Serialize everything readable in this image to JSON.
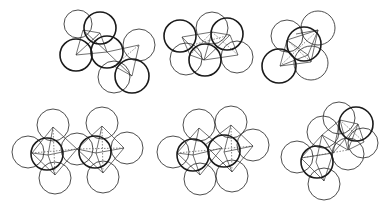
{
  "figure": {
    "width": 392,
    "height": 210,
    "background": "#ffffff",
    "stroke_color": "#1a1a1a",
    "panels": [
      {
        "id": "top-left",
        "spheres": [
          {
            "cx": 78,
            "cy": 24,
            "r": 14,
            "bold": false
          },
          {
            "cx": 139,
            "cy": 45,
            "r": 16,
            "bold": false
          },
          {
            "cx": 114,
            "cy": 77,
            "r": 16,
            "bold": false
          },
          {
            "cx": 107,
            "cy": 52,
            "r": 16,
            "bold": true
          },
          {
            "cx": 76,
            "cy": 55,
            "r": 16,
            "bold": true
          },
          {
            "cx": 100,
            "cy": 28,
            "r": 16,
            "bold": true
          },
          {
            "cx": 132,
            "cy": 76,
            "r": 17,
            "bold": true
          }
        ],
        "edges": [
          {
            "x1": 83,
            "y1": 30,
            "x2": 100,
            "y2": 33,
            "dashed": false
          },
          {
            "x1": 100,
            "y1": 33,
            "x2": 76,
            "y2": 55,
            "dashed": false
          },
          {
            "x1": 83,
            "y1": 30,
            "x2": 76,
            "y2": 55,
            "dashed": false
          },
          {
            "x1": 83,
            "y1": 30,
            "x2": 107,
            "y2": 52,
            "dashed": false
          },
          {
            "x1": 100,
            "y1": 33,
            "x2": 107,
            "y2": 52,
            "dashed": false
          },
          {
            "x1": 76,
            "y1": 55,
            "x2": 107,
            "y2": 52,
            "dashed": false
          },
          {
            "x1": 107,
            "y1": 52,
            "x2": 139,
            "y2": 45,
            "dashed": false
          },
          {
            "x1": 139,
            "y1": 45,
            "x2": 132,
            "y2": 76,
            "dashed": false
          },
          {
            "x1": 107,
            "y1": 52,
            "x2": 132,
            "y2": 76,
            "dashed": false
          },
          {
            "x1": 114,
            "y1": 66,
            "x2": 139,
            "y2": 45,
            "dashed": true
          },
          {
            "x1": 114,
            "y1": 66,
            "x2": 132,
            "y2": 76,
            "dashed": false
          },
          {
            "x1": 90,
            "y1": 42,
            "x2": 100,
            "y2": 33,
            "dashed": true
          }
        ]
      },
      {
        "id": "top-middle",
        "spheres": [
          {
            "cx": 186,
            "cy": 59,
            "r": 16,
            "bold": false
          },
          {
            "cx": 212,
            "cy": 28,
            "r": 16,
            "bold": false
          },
          {
            "cx": 237,
            "cy": 57,
            "r": 16,
            "bold": false
          },
          {
            "cx": 180,
            "cy": 36,
            "r": 16,
            "bold": true
          },
          {
            "cx": 227,
            "cy": 34,
            "r": 16,
            "bold": true
          },
          {
            "cx": 205,
            "cy": 60,
            "r": 16,
            "bold": true
          }
        ],
        "edges": [
          {
            "x1": 182,
            "y1": 37,
            "x2": 212,
            "y2": 32,
            "dashed": false
          },
          {
            "x1": 212,
            "y1": 32,
            "x2": 230,
            "y2": 35,
            "dashed": false
          },
          {
            "x1": 182,
            "y1": 37,
            "x2": 204,
            "y2": 60,
            "dashed": false
          },
          {
            "x1": 212,
            "y1": 32,
            "x2": 204,
            "y2": 60,
            "dashed": false
          },
          {
            "x1": 230,
            "y1": 35,
            "x2": 204,
            "y2": 60,
            "dashed": false
          },
          {
            "x1": 230,
            "y1": 35,
            "x2": 238,
            "y2": 55,
            "dashed": false
          },
          {
            "x1": 204,
            "y1": 60,
            "x2": 238,
            "y2": 55,
            "dashed": false
          },
          {
            "x1": 182,
            "y1": 37,
            "x2": 190,
            "y2": 55,
            "dashed": false
          },
          {
            "x1": 190,
            "y1": 55,
            "x2": 204,
            "y2": 60,
            "dashed": false
          },
          {
            "x1": 190,
            "y1": 55,
            "x2": 212,
            "y2": 32,
            "dashed": true
          },
          {
            "x1": 212,
            "y1": 32,
            "x2": 238,
            "y2": 55,
            "dashed": true
          },
          {
            "x1": 196,
            "y1": 44,
            "x2": 230,
            "y2": 35,
            "dashed": true
          }
        ]
      },
      {
        "id": "top-right",
        "spheres": [
          {
            "cx": 287,
            "cy": 36,
            "r": 16,
            "bold": false
          },
          {
            "cx": 318,
            "cy": 28,
            "r": 17,
            "bold": false
          },
          {
            "cx": 311,
            "cy": 63,
            "r": 17,
            "bold": false
          },
          {
            "cx": 304,
            "cy": 44,
            "r": 17,
            "bold": true
          },
          {
            "cx": 279,
            "cy": 66,
            "r": 17,
            "bold": true
          }
        ],
        "edges": [
          {
            "x1": 287,
            "y1": 40,
            "x2": 318,
            "y2": 30,
            "dashed": false
          },
          {
            "x1": 318,
            "y1": 30,
            "x2": 308,
            "y2": 55,
            "dashed": false
          },
          {
            "x1": 287,
            "y1": 40,
            "x2": 308,
            "y2": 55,
            "dashed": false
          },
          {
            "x1": 287,
            "y1": 40,
            "x2": 280,
            "y2": 66,
            "dashed": false
          },
          {
            "x1": 280,
            "y1": 66,
            "x2": 308,
            "y2": 55,
            "dashed": false
          },
          {
            "x1": 280,
            "y1": 66,
            "x2": 311,
            "y2": 62,
            "dashed": false
          },
          {
            "x1": 311,
            "y1": 62,
            "x2": 308,
            "y2": 55,
            "dashed": false
          },
          {
            "x1": 311,
            "y1": 62,
            "x2": 318,
            "y2": 30,
            "dashed": false
          },
          {
            "x1": 287,
            "y1": 40,
            "x2": 311,
            "y2": 62,
            "dashed": true
          },
          {
            "x1": 280,
            "y1": 66,
            "x2": 318,
            "y2": 30,
            "dashed": true
          },
          {
            "x1": 296,
            "y1": 34,
            "x2": 318,
            "y2": 30,
            "dashed": false
          }
        ]
      },
      {
        "id": "bottom-left",
        "spheres": [
          {
            "cx": 53,
            "cy": 125,
            "r": 16,
            "bold": false
          },
          {
            "cx": 28,
            "cy": 152,
            "r": 16,
            "bold": false
          },
          {
            "cx": 55,
            "cy": 178,
            "r": 16,
            "bold": false
          },
          {
            "cx": 77,
            "cy": 149,
            "r": 16,
            "bold": false
          },
          {
            "cx": 102,
            "cy": 123,
            "r": 16,
            "bold": false
          },
          {
            "cx": 127,
            "cy": 148,
            "r": 16,
            "bold": false
          },
          {
            "cx": 103,
            "cy": 177,
            "r": 16,
            "bold": false
          },
          {
            "cx": 47,
            "cy": 154,
            "r": 16,
            "bold": true
          },
          {
            "cx": 95,
            "cy": 152,
            "r": 16,
            "bold": true
          }
        ],
        "edges": [
          {
            "x1": 53,
            "y1": 127,
            "x2": 32,
            "y2": 153,
            "dashed": false
          },
          {
            "x1": 53,
            "y1": 127,
            "x2": 77,
            "y2": 149,
            "dashed": false
          },
          {
            "x1": 53,
            "y1": 127,
            "x2": 48,
            "y2": 155,
            "dashed": false
          },
          {
            "x1": 55,
            "y1": 175,
            "x2": 32,
            "y2": 153,
            "dashed": false
          },
          {
            "x1": 55,
            "y1": 175,
            "x2": 77,
            "y2": 149,
            "dashed": false
          },
          {
            "x1": 55,
            "y1": 175,
            "x2": 48,
            "y2": 155,
            "dashed": false
          },
          {
            "x1": 32,
            "y1": 153,
            "x2": 48,
            "y2": 155,
            "dashed": false
          },
          {
            "x1": 48,
            "y1": 155,
            "x2": 77,
            "y2": 149,
            "dashed": false
          },
          {
            "x1": 32,
            "y1": 153,
            "x2": 77,
            "y2": 149,
            "dashed": true
          },
          {
            "x1": 53,
            "y1": 127,
            "x2": 55,
            "y2": 175,
            "dashed": true
          },
          {
            "x1": 102,
            "y1": 126,
            "x2": 77,
            "y2": 149,
            "dashed": false
          },
          {
            "x1": 102,
            "y1": 126,
            "x2": 124,
            "y2": 148,
            "dashed": false
          },
          {
            "x1": 102,
            "y1": 126,
            "x2": 96,
            "y2": 153,
            "dashed": false
          },
          {
            "x1": 103,
            "y1": 173,
            "x2": 77,
            "y2": 149,
            "dashed": false
          },
          {
            "x1": 103,
            "y1": 173,
            "x2": 124,
            "y2": 148,
            "dashed": false
          },
          {
            "x1": 103,
            "y1": 173,
            "x2": 96,
            "y2": 153,
            "dashed": false
          },
          {
            "x1": 77,
            "y1": 149,
            "x2": 96,
            "y2": 153,
            "dashed": false
          },
          {
            "x1": 96,
            "y1": 153,
            "x2": 124,
            "y2": 148,
            "dashed": false
          },
          {
            "x1": 77,
            "y1": 149,
            "x2": 124,
            "y2": 148,
            "dashed": true
          },
          {
            "x1": 102,
            "y1": 126,
            "x2": 103,
            "y2": 173,
            "dashed": true
          }
        ]
      },
      {
        "id": "bottom-middle",
        "spheres": [
          {
            "cx": 199,
            "cy": 125,
            "r": 16,
            "bold": false
          },
          {
            "cx": 173,
            "cy": 152,
            "r": 16,
            "bold": false
          },
          {
            "cx": 200,
            "cy": 179,
            "r": 16,
            "bold": false
          },
          {
            "cx": 231,
            "cy": 122,
            "r": 16,
            "bold": false
          },
          {
            "cx": 253,
            "cy": 145,
            "r": 16,
            "bold": false
          },
          {
            "cx": 232,
            "cy": 176,
            "r": 16,
            "bold": false
          },
          {
            "cx": 193,
            "cy": 155,
            "r": 16,
            "bold": true
          },
          {
            "cx": 224,
            "cy": 151,
            "r": 16,
            "bold": true
          }
        ],
        "edges": [
          {
            "x1": 199,
            "y1": 128,
            "x2": 177,
            "y2": 153,
            "dashed": false
          },
          {
            "x1": 199,
            "y1": 128,
            "x2": 193,
            "y2": 155,
            "dashed": false
          },
          {
            "x1": 199,
            "y1": 128,
            "x2": 222,
            "y2": 148,
            "dashed": false
          },
          {
            "x1": 200,
            "y1": 175,
            "x2": 177,
            "y2": 153,
            "dashed": false
          },
          {
            "x1": 200,
            "y1": 175,
            "x2": 193,
            "y2": 155,
            "dashed": false
          },
          {
            "x1": 200,
            "y1": 175,
            "x2": 222,
            "y2": 148,
            "dashed": false
          },
          {
            "x1": 177,
            "y1": 153,
            "x2": 193,
            "y2": 155,
            "dashed": false
          },
          {
            "x1": 193,
            "y1": 155,
            "x2": 222,
            "y2": 148,
            "dashed": false
          },
          {
            "x1": 177,
            "y1": 153,
            "x2": 253,
            "y2": 146,
            "dashed": true
          },
          {
            "x1": 231,
            "y1": 125,
            "x2": 205,
            "y2": 145,
            "dashed": false
          },
          {
            "x1": 231,
            "y1": 125,
            "x2": 253,
            "y2": 146,
            "dashed": false
          },
          {
            "x1": 231,
            "y1": 125,
            "x2": 224,
            "y2": 152,
            "dashed": false
          },
          {
            "x1": 232,
            "y1": 172,
            "x2": 205,
            "y2": 145,
            "dashed": false
          },
          {
            "x1": 232,
            "y1": 172,
            "x2": 253,
            "y2": 146,
            "dashed": false
          },
          {
            "x1": 232,
            "y1": 172,
            "x2": 224,
            "y2": 152,
            "dashed": false
          },
          {
            "x1": 224,
            "y1": 152,
            "x2": 253,
            "y2": 146,
            "dashed": false
          },
          {
            "x1": 231,
            "y1": 125,
            "x2": 232,
            "y2": 172,
            "dashed": true
          }
        ]
      },
      {
        "id": "bottom-right",
        "spheres": [
          {
            "cx": 297,
            "cy": 157,
            "r": 16,
            "bold": false
          },
          {
            "cx": 324,
            "cy": 184,
            "r": 16,
            "bold": false
          },
          {
            "cx": 323,
            "cy": 132,
            "r": 16,
            "bold": false
          },
          {
            "cx": 339,
            "cy": 118,
            "r": 16,
            "bold": false
          },
          {
            "cx": 363,
            "cy": 143,
            "r": 15,
            "bold": false
          },
          {
            "cx": 348,
            "cy": 154,
            "r": 16,
            "bold": false
          },
          {
            "cx": 356,
            "cy": 124,
            "r": 17,
            "bold": true
          },
          {
            "cx": 317,
            "cy": 162,
            "r": 16,
            "bold": true
          }
        ],
        "edges": [
          {
            "x1": 301,
            "y1": 158,
            "x2": 333,
            "y2": 153,
            "dashed": false
          },
          {
            "x1": 301,
            "y1": 158,
            "x2": 324,
            "y2": 181,
            "dashed": false
          },
          {
            "x1": 324,
            "y1": 181,
            "x2": 333,
            "y2": 153,
            "dashed": false
          },
          {
            "x1": 301,
            "y1": 158,
            "x2": 322,
            "y2": 135,
            "dashed": false
          },
          {
            "x1": 322,
            "y1": 135,
            "x2": 333,
            "y2": 153,
            "dashed": false
          },
          {
            "x1": 322,
            "y1": 135,
            "x2": 316,
            "y2": 162,
            "dashed": false
          },
          {
            "x1": 316,
            "y1": 162,
            "x2": 324,
            "y2": 181,
            "dashed": false
          },
          {
            "x1": 301,
            "y1": 158,
            "x2": 348,
            "y2": 150,
            "dashed": true
          },
          {
            "x1": 322,
            "y1": 135,
            "x2": 340,
            "y2": 120,
            "dashed": false
          },
          {
            "x1": 340,
            "y1": 120,
            "x2": 358,
            "y2": 124,
            "dashed": false
          },
          {
            "x1": 358,
            "y1": 124,
            "x2": 364,
            "y2": 142,
            "dashed": false
          },
          {
            "x1": 340,
            "y1": 120,
            "x2": 348,
            "y2": 150,
            "dashed": false
          },
          {
            "x1": 358,
            "y1": 124,
            "x2": 348,
            "y2": 150,
            "dashed": false
          },
          {
            "x1": 364,
            "y1": 142,
            "x2": 348,
            "y2": 150,
            "dashed": false
          },
          {
            "x1": 322,
            "y1": 135,
            "x2": 348,
            "y2": 150,
            "dashed": false
          },
          {
            "x1": 333,
            "y1": 153,
            "x2": 358,
            "y2": 124,
            "dashed": false
          },
          {
            "x1": 340,
            "y1": 120,
            "x2": 364,
            "y2": 142,
            "dashed": true
          },
          {
            "x1": 333,
            "y1": 153,
            "x2": 340,
            "y2": 120,
            "dashed": false
          }
        ]
      }
    ]
  }
}
